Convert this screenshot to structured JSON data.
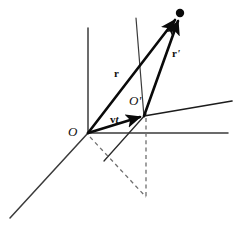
{
  "figure": {
    "kind": "vector-diagram",
    "canvas": {
      "width": 242,
      "height": 227,
      "background": "#ffffff"
    },
    "colors": {
      "ink": "#111111",
      "axis": "#3b3b3b",
      "vector": "#0a0a0a",
      "dashed": "#6b6b6b",
      "background": "#ffffff"
    },
    "labels": [
      {
        "id": "origin-o",
        "text": "O",
        "prime": "",
        "style": "frame",
        "x": 68,
        "y": 125
      },
      {
        "id": "origin-o-prime",
        "text": "O",
        "prime": "'",
        "style": "frame",
        "x": 129,
        "y": 94
      },
      {
        "id": "vector-r",
        "text": "r",
        "prime": "",
        "style": "vector",
        "x": 114,
        "y": 68
      },
      {
        "id": "vector-r-prime",
        "text": "r",
        "prime": "'",
        "style": "vector",
        "x": 172,
        "y": 48
      },
      {
        "id": "vector-vt",
        "text": "v",
        "italic": "t",
        "style": "vector",
        "x": 110,
        "y": 114
      }
    ],
    "points": [
      {
        "id": "event-point",
        "x": 180,
        "y": 13,
        "r": 4.2
      }
    ],
    "axes": [
      {
        "id": "axis-o-vertical",
        "x1": 88,
        "y1": 133,
        "x2": 88,
        "y2": 28,
        "width": 1.5
      },
      {
        "id": "axis-o-horizontal",
        "x1": 88,
        "y1": 133,
        "x2": 228,
        "y2": 133,
        "width": 1.5
      },
      {
        "id": "axis-o-depth",
        "x1": 88,
        "y1": 133,
        "x2": 10,
        "y2": 218,
        "width": 1.5
      },
      {
        "id": "axis-oprime-vertical",
        "x1": 144,
        "y1": 117,
        "x2": 136,
        "y2": 18,
        "width": 1.2
      },
      {
        "id": "axis-oprime-horizontal",
        "x1": 144,
        "y1": 116,
        "x2": 232,
        "y2": 101,
        "width": 1.6
      },
      {
        "id": "axis-oprime-depth",
        "x1": 144,
        "y1": 116,
        "x2": 104,
        "y2": 161,
        "width": 1.3
      }
    ],
    "vectors": [
      {
        "id": "vector-r-arrow",
        "x1": 88,
        "y1": 133,
        "x2": 177,
        "y2": 17,
        "width": 2.6
      },
      {
        "id": "vector-r-prime-arrow",
        "x1": 144,
        "y1": 116,
        "x2": 179,
        "y2": 18,
        "width": 2.6
      },
      {
        "id": "vector-vt-arrow",
        "x1": 88,
        "y1": 133,
        "x2": 143,
        "y2": 116,
        "width": 2.6
      }
    ],
    "dashed": [
      {
        "id": "dash-drop-oprime",
        "x1": 146,
        "y1": 118,
        "x2": 146,
        "y2": 197
      },
      {
        "id": "dash-ground-o",
        "x1": 90,
        "y1": 136,
        "x2": 146,
        "y2": 197
      }
    ]
  }
}
